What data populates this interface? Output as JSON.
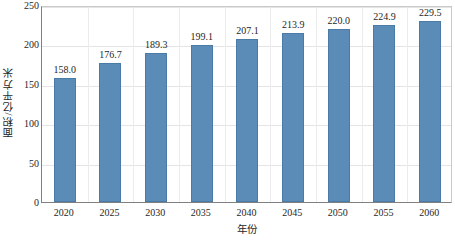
{
  "chart_data": {
    "type": "bar",
    "title": "",
    "xlabel": "年份",
    "ylabel": "面积/亿平方米",
    "categories": [
      "2020",
      "2025",
      "2030",
      "2035",
      "2040",
      "2045",
      "2050",
      "2055",
      "2060"
    ],
    "values": [
      158.0,
      176.7,
      189.3,
      199.1,
      207.1,
      213.9,
      220.0,
      224.9,
      229.5
    ],
    "value_labels": [
      "158.0",
      "176.7",
      "189.3",
      "199.1",
      "207.1",
      "213.9",
      "220.0",
      "224.9",
      "229.5"
    ],
    "series": [
      {
        "name": "面积",
        "values": [
          158.0,
          176.7,
          189.3,
          199.1,
          207.1,
          213.9,
          220.0,
          224.9,
          229.5
        ]
      }
    ],
    "ylim": [
      0,
      250
    ],
    "yticks": [
      0,
      50,
      100,
      150,
      200,
      250
    ],
    "ytick_labels": [
      "0",
      "50",
      "100",
      "150",
      "200",
      "250"
    ],
    "grid": {
      "horizontal": true,
      "vertical": true
    },
    "legend": {
      "visible": false,
      "position": "none"
    },
    "colors": {
      "bar_fill": "#5b8cb8",
      "bar_edge": "#4a7ba7",
      "grid_horizontal": "#e4e4e4",
      "grid_vertical": "#ececec",
      "axis_line": "#808080",
      "text": "#1f1f1f",
      "background": "#ffffff"
    }
  }
}
